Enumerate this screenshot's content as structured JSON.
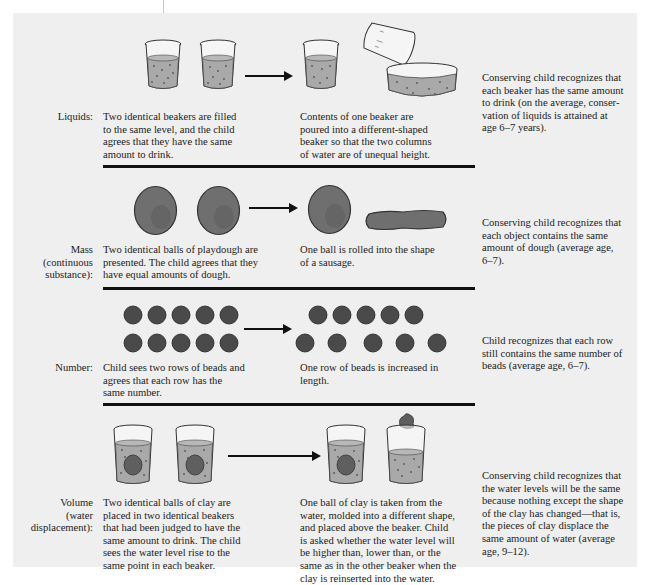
{
  "figure": {
    "colors": {
      "panel_bg": "#efefef",
      "water": "#a9a9a9",
      "dough": "#6f6f6f",
      "bead": "#4a4a4a",
      "rule": "#111111"
    },
    "rows": [
      {
        "id": "liquids",
        "label": "Liquids:",
        "before": "Two identical beakers are filled\nto the same level, and the child\nagrees that they have the same\namount to drink.",
        "after": "Contents of one beaker are\npoured into a different-shaped\nbeaker so that the two columns\nof water are of unequal height.",
        "outcome": "Conserving child recognizes that\neach beaker has the same amount\nto drink (on the average, conser-\nvation of liquids is attained at\nage 6–7 years).",
        "icons": [
          "beaker-icon",
          "beaker-icon",
          "arrow-icon",
          "beaker-icon",
          "tilted-beaker-icon",
          "wide-dish-icon"
        ]
      },
      {
        "id": "mass",
        "label": "Mass\n(continuous\nsubstance):",
        "before": "Two identical balls of playdough are\npresented. The child agrees that they\nhave equal amounts of dough.",
        "after": "One ball is rolled into the shape\nof a sausage.",
        "outcome": "Conserving child recognizes that\neach object contains the same\namount of dough (average age,\n6–7).",
        "icons": [
          "dough-ball-icon",
          "dough-ball-icon",
          "arrow-icon",
          "dough-ball-icon",
          "dough-sausage-icon"
        ]
      },
      {
        "id": "number",
        "label": "Number:",
        "before": "Child sees two rows of beads and\nagrees that each row has the\nsame number.",
        "after": "One row of beads is increased in\nlength.",
        "outcome": "Child recognizes that each row\nstill contains the same number of\nbeads (average age, 6–7).",
        "beads_per_row": 5,
        "icons": [
          "bead-rows-icon",
          "arrow-icon",
          "spread-bead-rows-icon"
        ]
      },
      {
        "id": "volume",
        "label": "Volume\n(water\ndisplacement):",
        "before": "Two identical balls of clay are\nplaced in two identical beakers\nthat had been judged to have the\nsame amount to drink. The child\nsees the water level rise to the\nsame point in each beaker.",
        "after": "One ball of clay is taken from the\nwater, molded into a different shape,\nand placed above the beaker. Child\nis asked whether the water level will\nbe higher than, lower than, or the\nsame as in the other beaker when the\nclay is reinserted into the water.",
        "outcome": "Conserving child recognizes that\nthe water levels will be the same\nbecause nothing except the shape\nof the clay has changed—that is,\nthe pieces of clay displace the\nsame amount of water (average\nage, 9–12).",
        "icons": [
          "beaker-with-clay-icon",
          "beaker-with-clay-icon",
          "arrow-icon",
          "beaker-with-clay-icon",
          "beaker-clay-above-icon"
        ]
      }
    ]
  }
}
